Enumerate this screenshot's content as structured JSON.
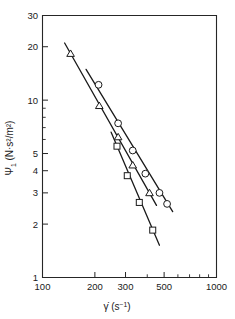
{
  "chart_data": {
    "type": "scatter",
    "title": "",
    "xlabel": "γ̇ (s⁻¹)",
    "ylabel": "Ψ₁ (N·s²/m²)",
    "xscale": "log",
    "yscale": "log",
    "xlim": [
      100,
      1000
    ],
    "ylim": [
      1,
      30
    ],
    "grid": false,
    "legend": "none",
    "xticks": [
      100,
      200,
      300,
      500,
      1000
    ],
    "xtick_labels": [
      "100",
      "200",
      "300",
      "500",
      "1000"
    ],
    "xminor_ticks": [
      400,
      600,
      700,
      800,
      900
    ],
    "yticks": [
      1,
      2,
      3,
      4,
      5,
      10,
      20,
      30
    ],
    "ytick_labels": [
      "1",
      "2",
      "3",
      "4",
      "5",
      "10",
      "20",
      "30"
    ],
    "yminor_ticks": [
      6,
      7,
      8,
      9
    ],
    "series": [
      {
        "name": "circles",
        "marker": "circle",
        "points": [
          {
            "x": 210,
            "y": 12.2
          },
          {
            "x": 272,
            "y": 7.4
          },
          {
            "x": 330,
            "y": 5.2
          },
          {
            "x": 390,
            "y": 3.85
          },
          {
            "x": 470,
            "y": 3.0
          },
          {
            "x": 520,
            "y": 2.6
          }
        ],
        "fit_x": [
          178,
          560
        ],
        "fit_y": [
          14.9,
          2.35
        ]
      },
      {
        "name": "triangles",
        "marker": "triangle",
        "points": [
          {
            "x": 145,
            "y": 18.3
          },
          {
            "x": 212,
            "y": 9.3
          },
          {
            "x": 272,
            "y": 6.2
          },
          {
            "x": 330,
            "y": 4.3
          },
          {
            "x": 412,
            "y": 3.0
          }
        ],
        "fit_x": [
          134,
          452
        ],
        "fit_y": [
          21.0,
          2.55
        ]
      },
      {
        "name": "squares",
        "marker": "square",
        "points": [
          {
            "x": 268,
            "y": 5.5
          },
          {
            "x": 307,
            "y": 3.75
          },
          {
            "x": 360,
            "y": 2.65
          },
          {
            "x": 430,
            "y": 1.85
          }
        ],
        "fit_x": [
          248,
          470
        ],
        "fit_y": [
          6.6,
          1.52
        ]
      }
    ]
  },
  "axis_titles": {
    "x_symbol": "γ̇",
    "x_unit_open": " (s",
    "x_unit_exp": "−1",
    "x_unit_close": ")",
    "y_symbol": "Ψ",
    "y_sub": "1",
    "y_unit": " (N·s²/m²)"
  }
}
